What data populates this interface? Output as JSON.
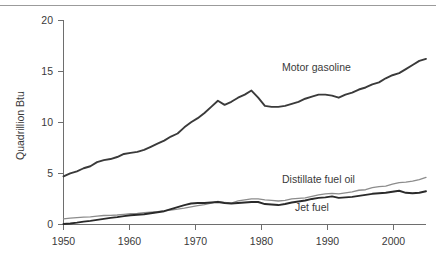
{
  "chart_data": {
    "type": "line",
    "title": "",
    "xlabel": "",
    "ylabel": "Quadrillion Btu",
    "xlim": [
      1950,
      2004
    ],
    "ylim": [
      0,
      20
    ],
    "grid": false,
    "legend_position": "inline-annotations",
    "xticks": [
      1950,
      1960,
      1970,
      1980,
      1990,
      2000
    ],
    "xticklabels": [
      "1950",
      "1960",
      "1970",
      "1980",
      "1990",
      "2000"
    ],
    "yticks": [
      0,
      5,
      10,
      15,
      20
    ],
    "yticklabels": [
      "0",
      "5",
      "10",
      "15",
      "20"
    ],
    "x": [
      1950,
      1951,
      1952,
      1953,
      1954,
      1955,
      1956,
      1957,
      1958,
      1959,
      1960,
      1961,
      1962,
      1963,
      1964,
      1965,
      1966,
      1967,
      1968,
      1969,
      1970,
      1971,
      1972,
      1973,
      1974,
      1975,
      1976,
      1977,
      1978,
      1979,
      1980,
      1981,
      1982,
      1983,
      1984,
      1985,
      1986,
      1987,
      1988,
      1989,
      1990,
      1991,
      1992,
      1993,
      1994,
      1995,
      1996,
      1997,
      1998,
      1999,
      2000,
      2001,
      2002,
      2003,
      2004
    ],
    "series": [
      {
        "name": "Motor gasoline",
        "color": "#3a3a3a",
        "width": 1.9,
        "label_x": 1983,
        "label_y": 15.3,
        "values": [
          4.7,
          5.0,
          5.2,
          5.5,
          5.7,
          6.1,
          6.3,
          6.4,
          6.6,
          6.9,
          7.0,
          7.1,
          7.3,
          7.6,
          7.9,
          8.2,
          8.6,
          8.9,
          9.5,
          10.0,
          10.4,
          10.9,
          11.5,
          12.1,
          11.7,
          12.0,
          12.4,
          12.7,
          13.1,
          12.4,
          11.6,
          11.5,
          11.5,
          11.6,
          11.8,
          12.0,
          12.3,
          12.5,
          12.7,
          12.7,
          12.6,
          12.4,
          12.7,
          12.9,
          13.2,
          13.4,
          13.7,
          13.9,
          14.3,
          14.6,
          14.8,
          15.2,
          15.6,
          16.0,
          16.2
        ],
        "end_label_value": 17.0
      },
      {
        "name": "Distillate fuel oil",
        "color": "#8c8c8c",
        "width": 1.3,
        "label_x": 1989,
        "label_y": 3.7,
        "values": [
          0.55,
          0.62,
          0.68,
          0.72,
          0.74,
          0.82,
          0.88,
          0.9,
          0.93,
          1.0,
          1.05,
          1.08,
          1.15,
          1.2,
          1.25,
          1.32,
          1.42,
          1.5,
          1.6,
          1.72,
          1.85,
          1.95,
          2.1,
          2.25,
          2.15,
          2.1,
          2.3,
          2.4,
          2.5,
          2.5,
          2.4,
          2.35,
          2.3,
          2.35,
          2.5,
          2.55,
          2.6,
          2.75,
          2.9,
          3.0,
          3.05,
          3.0,
          3.1,
          3.2,
          3.35,
          3.4,
          3.6,
          3.7,
          3.75,
          3.95,
          4.1,
          4.15,
          4.25,
          4.4,
          4.6
        ],
        "end_label_value": 5.6
      },
      {
        "name": "Jet fuel",
        "color": "#2a2a2a",
        "width": 1.9,
        "label_x": 1988,
        "label_y": 1.35,
        "values": [
          0.05,
          0.1,
          0.18,
          0.28,
          0.35,
          0.45,
          0.55,
          0.65,
          0.72,
          0.82,
          0.9,
          0.95,
          1.0,
          1.1,
          1.2,
          1.3,
          1.5,
          1.7,
          1.9,
          2.05,
          2.1,
          2.1,
          2.15,
          2.2,
          2.1,
          2.05,
          2.1,
          2.15,
          2.2,
          2.2,
          2.0,
          1.95,
          1.9,
          2.0,
          2.15,
          2.25,
          2.35,
          2.5,
          2.6,
          2.65,
          2.75,
          2.6,
          2.65,
          2.7,
          2.8,
          2.9,
          3.0,
          3.05,
          3.1,
          3.2,
          3.3,
          3.1,
          3.05,
          3.1,
          3.25
        ],
        "end_label_value": 3.3
      }
    ]
  },
  "labels": {
    "y_axis_title": "Quadrillion Btu",
    "motor_gasoline": "Motor gasoline",
    "distillate_fuel_oil": "Distillate fuel oil",
    "jet_fuel": "Jet fuel",
    "y0": "0",
    "y5": "5",
    "y10": "10",
    "y15": "15",
    "y20": "20",
    "x1950": "1950",
    "x1960": "1960",
    "x1970": "1970",
    "x1980": "1980",
    "x1990": "1990",
    "x2000": "2000"
  },
  "colors": {
    "axis": "#6e6e6e",
    "text": "#3a3a3a",
    "motor_gasoline": "#3a3a3a",
    "distillate": "#8c8c8c",
    "jet_fuel": "#2a2a2a",
    "top_rule": "#9b9b9b",
    "background": "#ffffff"
  }
}
